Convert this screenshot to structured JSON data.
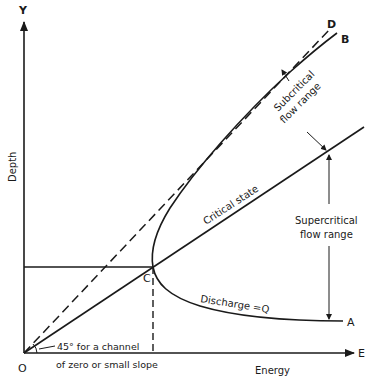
{
  "diagram": {
    "axes": {
      "y_axis_letter": "Y",
      "x_axis_letter": "E",
      "origin_letter": "O",
      "y_label": "Depth",
      "x_label": "Energy"
    },
    "points": {
      "critical_point": "C",
      "upper_limb_end": "B",
      "lower_limb_end": "A",
      "dashed_line_end": "D"
    },
    "annotations": {
      "critical_state": "Critical state",
      "subcritical_line1": "Subcritical",
      "subcritical_line2": "flow range",
      "supercritical_line1": "Supercritical",
      "supercritical_line2": "flow range",
      "discharge": "Discharge =Q",
      "angle_line1": "45° for a channel",
      "angle_line2": "of zero or small slope"
    },
    "colors": {
      "ink": "#1a1a1a",
      "background": "#ffffff"
    }
  }
}
